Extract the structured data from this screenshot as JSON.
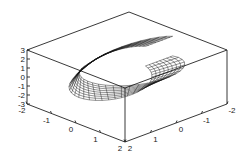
{
  "chart_data": {
    "type": "surface3d",
    "title": "",
    "xlabel": "",
    "ylabel": "",
    "zlabel": "",
    "style": "wireframe",
    "grid": false,
    "x_range": [
      -2,
      2
    ],
    "y_range": [
      -2,
      2
    ],
    "z_range": [
      -3,
      3
    ],
    "x_ticks": [
      "-2",
      "-1",
      "0",
      "1",
      "2"
    ],
    "y_ticks": [
      "2",
      "1",
      "0",
      "-1",
      "-2"
    ],
    "z_ticks": [
      "3",
      "2",
      "1",
      "0",
      "-1",
      "-2",
      "-3"
    ],
    "surface": {
      "description": "twisted band mesh, flat near z=0 on the left curving upward to z≈3 at the back-right",
      "u_range": [
        0,
        6.283
      ],
      "v_range": [
        -0.5,
        0.5
      ],
      "u_steps": 40,
      "v_steps": 8
    },
    "colors": {
      "line": "#111111",
      "box": "#222222",
      "background": "#ffffff"
    }
  }
}
